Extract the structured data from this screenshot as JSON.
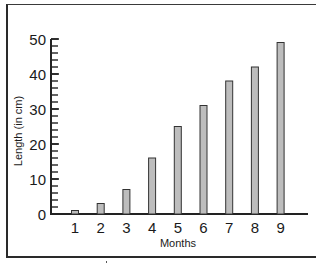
{
  "chart_data": {
    "type": "bar",
    "title": "",
    "xlabel": "Months",
    "ylabel": "Length (in cm)",
    "categories": [
      "1",
      "2",
      "3",
      "4",
      "5",
      "6",
      "7",
      "8",
      "9"
    ],
    "values": [
      1,
      3,
      7,
      16,
      25,
      31,
      38,
      42,
      49
    ],
    "ylim": [
      0,
      50
    ],
    "yticks": [
      0,
      10,
      20,
      30,
      40,
      50
    ],
    "minor_tick_step": 2,
    "grid": false,
    "legend": null,
    "colors": {
      "bar_fill": "#bdbdbd",
      "bar_stroke": "#333333",
      "axis": "#222222"
    }
  }
}
